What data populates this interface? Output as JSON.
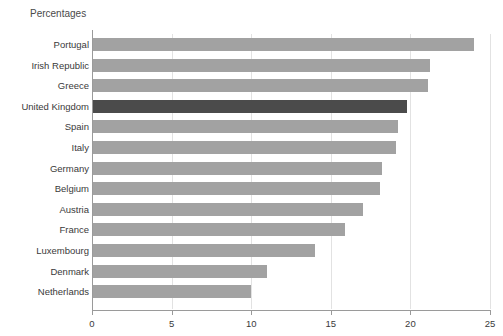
{
  "chart_data": {
    "type": "bar",
    "orientation": "horizontal",
    "title": "Percentages",
    "xlabel": "",
    "ylabel": "",
    "xlim": [
      0,
      25
    ],
    "xticks": [
      0,
      5,
      10,
      15,
      20,
      25
    ],
    "xtick_labels": [
      "0",
      "5",
      "10",
      "15",
      "20",
      "25"
    ],
    "grid": true,
    "grid_axis": "x",
    "legend": "none",
    "categories": [
      "Portugal",
      "Irish Republic",
      "Greece",
      "United Kingdom",
      "Spain",
      "Italy",
      "Germany",
      "Belgium",
      "Austria",
      "France",
      "Luxembourg",
      "Denmark",
      "Netherlands"
    ],
    "values": [
      24.0,
      21.2,
      21.1,
      19.8,
      19.2,
      19.1,
      18.2,
      18.1,
      17.0,
      15.9,
      14.0,
      11.0,
      10.0
    ],
    "highlight_category": "United Kingdom",
    "colors": {
      "bar": "#a2a2a2",
      "bar_highlight": "#4b4b4b",
      "gridline": "#e2e2e2",
      "axis": "#9a9a9a",
      "text": "#3a3a3a",
      "background": "#ffffff"
    }
  }
}
